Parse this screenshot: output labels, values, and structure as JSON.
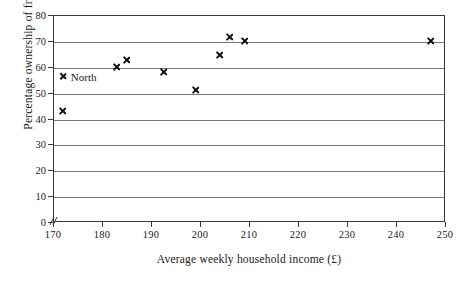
{
  "chart_data": {
    "type": "scatter",
    "title": "",
    "xlabel": "Average weekly household income (£)",
    "ylabel": "Percentage ownership of freezers",
    "xlim": [
      170,
      250
    ],
    "ylim": [
      0,
      80
    ],
    "xticks": [
      170,
      180,
      190,
      200,
      210,
      220,
      230,
      240,
      250
    ],
    "yticks": [
      0,
      10,
      20,
      30,
      40,
      50,
      60,
      70,
      80
    ],
    "xtick_labels": [
      "170",
      "180",
      "190",
      "200",
      "210",
      "220",
      "230",
      "240",
      "250"
    ],
    "ytick_labels": [
      "0",
      "10",
      "20",
      "30",
      "40",
      "50",
      "60",
      "70",
      "80"
    ],
    "grid": "horizontal",
    "axis_break": "x-axis broken between 0 and 170",
    "legend": {
      "position": "inside-plot-upper-left",
      "entries": [
        {
          "label": "North",
          "marker": "x",
          "x": 172,
          "y": 56.5
        }
      ]
    },
    "marker_style": "x",
    "marker_color": "#111111",
    "series": [
      {
        "name": "North",
        "points": [
          {
            "x": 172,
            "y": 43
          },
          {
            "x": 183,
            "y": 60
          },
          {
            "x": 185,
            "y": 62.5
          },
          {
            "x": 192.5,
            "y": 58
          },
          {
            "x": 199,
            "y": 51
          },
          {
            "x": 204,
            "y": 64.5
          },
          {
            "x": 206,
            "y": 71.5
          },
          {
            "x": 209,
            "y": 70
          },
          {
            "x": 247,
            "y": 70
          }
        ]
      }
    ]
  },
  "colors": {
    "axis": "#3a3a3a",
    "gridline": "#777777",
    "marker": "#111111",
    "background": "#ffffff",
    "text": "#1a1a1a"
  }
}
